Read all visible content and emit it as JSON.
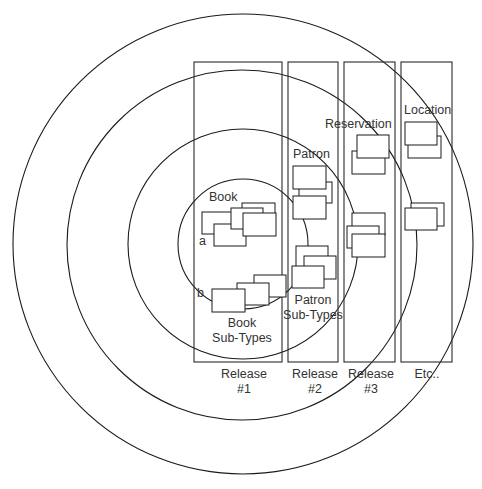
{
  "diagram": {
    "title": "",
    "colors": {
      "stroke": "#1a1a1a",
      "text": "#333333",
      "background": "#ffffff"
    },
    "rings": [
      {
        "cx": 243,
        "cy": 244,
        "r": 230
      },
      {
        "cx": 242,
        "cy": 245,
        "r": 175
      },
      {
        "cx": 243,
        "cy": 244,
        "r": 115
      },
      {
        "cx": 243,
        "cy": 244,
        "r": 65
      }
    ],
    "columns": [
      {
        "id": "release-1",
        "x": 194,
        "y": 62,
        "w": 88,
        "h": 300,
        "label_line1": "Release",
        "label_line2": "#1"
      },
      {
        "id": "release-2",
        "x": 288,
        "y": 62,
        "w": 50,
        "h": 300,
        "label_line1": "Release",
        "label_line2": "#2"
      },
      {
        "id": "release-3",
        "x": 344,
        "y": 62,
        "w": 51,
        "h": 300,
        "label_line1": "Release",
        "label_line2": "#3"
      },
      {
        "id": "etc",
        "x": 401,
        "y": 62,
        "w": 51,
        "h": 300,
        "label_line1": "Etc..",
        "label_line2": ""
      }
    ],
    "labels": {
      "book": "Book",
      "a": "a",
      "b": "b",
      "book_subtypes_line1": "Book",
      "book_subtypes_line2": "Sub-Types",
      "patron": "Patron",
      "patron_subtypes_line1": "Patron",
      "patron_subtypes_line2": "Sub-Types",
      "reservation": "Reservation",
      "location": "Location"
    },
    "boxes": {
      "book": [
        {
          "x": 202,
          "y": 212,
          "w": 43,
          "h": 22
        },
        {
          "x": 214,
          "y": 224,
          "w": 32,
          "h": 22
        },
        {
          "x": 242,
          "y": 203,
          "w": 33,
          "h": 22
        },
        {
          "x": 231,
          "y": 208,
          "w": 32,
          "h": 21
        },
        {
          "x": 243,
          "y": 213,
          "w": 33,
          "h": 23
        }
      ],
      "book_subtypes": [
        {
          "x": 254,
          "y": 275,
          "w": 32,
          "h": 22
        },
        {
          "x": 237,
          "y": 283,
          "w": 32,
          "h": 22
        },
        {
          "x": 212,
          "y": 289,
          "w": 33,
          "h": 23
        }
      ],
      "patron": [
        {
          "x": 299,
          "y": 182,
          "w": 33,
          "h": 21
        },
        {
          "x": 293,
          "y": 166,
          "w": 33,
          "h": 23
        },
        {
          "x": 293,
          "y": 196,
          "w": 33,
          "h": 23
        }
      ],
      "patron_subtypes": [
        {
          "x": 296,
          "y": 246,
          "w": 32,
          "h": 22
        },
        {
          "x": 304,
          "y": 256,
          "w": 32,
          "h": 23
        },
        {
          "x": 292,
          "y": 266,
          "w": 32,
          "h": 22
        }
      ],
      "reservation": [
        {
          "x": 352,
          "y": 151,
          "w": 33,
          "h": 23
        },
        {
          "x": 357,
          "y": 135,
          "w": 32,
          "h": 23
        }
      ],
      "release3_stack": [
        {
          "x": 352,
          "y": 213,
          "w": 33,
          "h": 22
        },
        {
          "x": 347,
          "y": 226,
          "w": 32,
          "h": 22
        },
        {
          "x": 352,
          "y": 234,
          "w": 33,
          "h": 23
        }
      ],
      "location": [
        {
          "x": 408,
          "y": 136,
          "w": 33,
          "h": 22
        },
        {
          "x": 405,
          "y": 122,
          "w": 32,
          "h": 23
        }
      ],
      "etc_stack": [
        {
          "x": 411,
          "y": 203,
          "w": 33,
          "h": 23
        },
        {
          "x": 405,
          "y": 208,
          "w": 32,
          "h": 22
        }
      ]
    }
  }
}
